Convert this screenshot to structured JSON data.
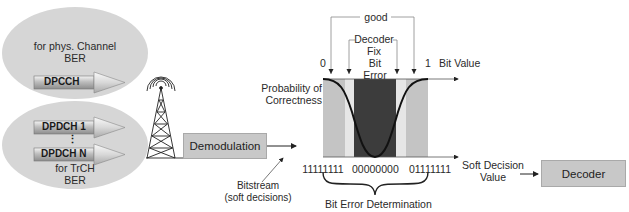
{
  "left_groups": {
    "top": {
      "title_line1": "for phys. Channel",
      "title_line2": "BER",
      "channels": [
        "DPCCH"
      ]
    },
    "bottom": {
      "channels": [
        "DPDCH 1",
        "DPDCH N"
      ],
      "ellipsis": "⋮",
      "title_line1": "for TrCH",
      "title_line2": "BER"
    }
  },
  "antenna": {
    "icon": "radio-tower-icon"
  },
  "demodulation": {
    "label": "Demodulation"
  },
  "bitstream": {
    "line1": "Bitstream",
    "line2": "(soft decisions)"
  },
  "chart": {
    "top_axis_left": "0",
    "top_axis_right": "1",
    "top_axis_label": "Bit Value",
    "y_label_line1": "Probability of",
    "y_label_line2": "Correctness",
    "bracket_good": "good",
    "bracket_decoder_fix_line1": "Decoder",
    "bracket_decoder_fix_line2": "Fix",
    "bit_error_line1": "Bit",
    "bit_error_line2": "Error",
    "bottom_ticks": [
      "11111111",
      "00000000",
      "01111111"
    ],
    "bottom_axis_label_line1": "Soft Decision",
    "bottom_axis_label_line2": "Value",
    "brace_label": "Bit Error Determination",
    "colors": {
      "good": "#c4c4c4",
      "fix": "#e6e6e6",
      "error": "#3c3c3c",
      "curve": "#111111"
    }
  },
  "decoder": {
    "label": "Decoder"
  }
}
